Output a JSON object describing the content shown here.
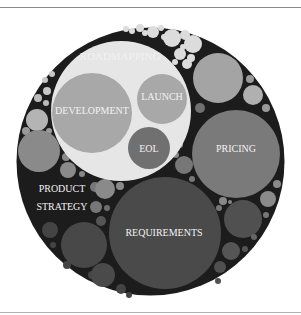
{
  "diagram": {
    "type": "circle-packing",
    "root": {
      "label": "PRODUCT STRATEGY",
      "color": "#1c1c1c"
    },
    "groups": [
      {
        "label": "ROADMAPPING",
        "color": "#e6e6e6",
        "children": [
          {
            "label": "DEVELOPMENT",
            "color": "#a8a8a8"
          },
          {
            "label": "LAUNCH",
            "color": "#a8a8a8"
          },
          {
            "label": "EOL",
            "color": "#707070"
          }
        ]
      },
      {
        "label": "PRICING",
        "color": "#7a7a7a"
      },
      {
        "label": "REQUIREMENTS",
        "color": "#4a4a4a"
      }
    ]
  },
  "labels": {
    "roadmapping": "ROADMAPPING",
    "development": "DEVELOPMENT",
    "launch": "LAUNCH",
    "eol": "EOL",
    "pricing": "PRICING",
    "product_line1": "PRODUCT",
    "product_line2": "STRATEGY",
    "requirements": "REQUIREMENTS"
  }
}
